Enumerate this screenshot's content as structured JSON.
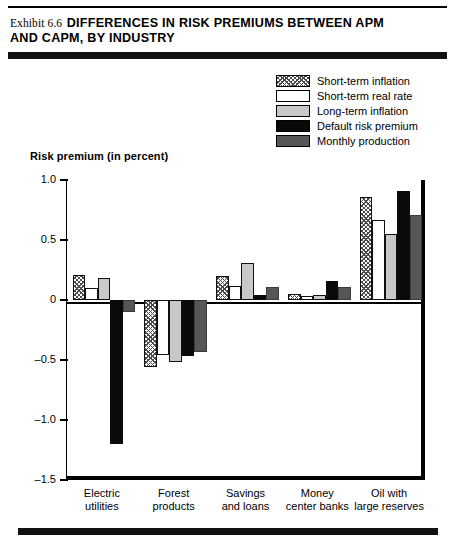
{
  "header": {
    "exhibit_label": "Exhibit 6.6",
    "title_line1": "DIFFERENCES IN RISK PREMIUMS BETWEEN APM",
    "title_line2": "AND CAPM, BY INDUSTRY"
  },
  "chart_data": {
    "type": "bar",
    "title": "Exhibit 6.6 DIFFERENCES IN RISK PREMIUMS BETWEEN APM AND CAPM, BY INDUSTRY",
    "xlabel": "",
    "ylabel": "Risk premium (in percent)",
    "ylim": [
      -1.5,
      1.0
    ],
    "yticks": [
      "1.0",
      "0.5",
      "0",
      "-0.5",
      "-1.0",
      "-1.5"
    ],
    "ytick_values": [
      1.0,
      0.5,
      0,
      -0.5,
      -1.0,
      -1.5
    ],
    "grid": false,
    "legend_position": "top-right",
    "categories": [
      "Electric utilities",
      "Forest products",
      "Savings and loans",
      "Money center banks",
      "Oil with large reserves"
    ],
    "category_lines": [
      [
        "Electric",
        "utilities"
      ],
      [
        "Forest",
        "products"
      ],
      [
        "Savings",
        "and loans"
      ],
      [
        "Money",
        "center banks"
      ],
      [
        "Oil with",
        "large reserves"
      ]
    ],
    "series": [
      {
        "name": "Short-term inflation",
        "fill": "hatch",
        "color": "#ffffff",
        "values": [
          0.21,
          -0.56,
          0.2,
          0.05,
          0.86
        ]
      },
      {
        "name": "Short-term real rate",
        "fill": "white",
        "color": "#ffffff",
        "values": [
          0.1,
          -0.46,
          0.12,
          0.03,
          0.67
        ]
      },
      {
        "name": "Long-term inflation",
        "fill": "light-gray",
        "color": "#c8c8c8",
        "values": [
          0.18,
          -0.52,
          0.31,
          0.04,
          0.55
        ]
      },
      {
        "name": "Default risk premium",
        "fill": "black",
        "color": "#0a0a0a",
        "values": [
          -1.2,
          -0.47,
          0.04,
          0.16,
          0.91
        ]
      },
      {
        "name": "Monthly production",
        "fill": "dark-gray",
        "color": "#565656",
        "values": [
          -0.1,
          -0.43,
          0.11,
          0.11,
          0.71
        ]
      }
    ]
  }
}
